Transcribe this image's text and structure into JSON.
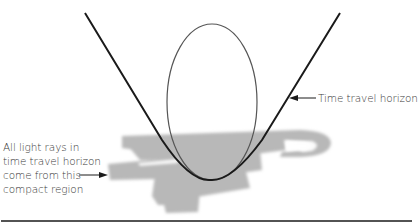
{
  "figure": {
    "labels": {
      "horizon": "Time travel horizon",
      "region_lines": [
        "All light rays in",
        "time travel horizon",
        "come from this",
        "compact region"
      ]
    },
    "colors": {
      "background": "#ffffff",
      "curve": "#1a1a1a",
      "ellipse": "#555555",
      "region_fill": "#b8b8b8",
      "text": "#3a3a3a",
      "baseline": "#1a1a1a"
    },
    "elements": {
      "horizon_curve": "V-shaped parabola with vertex near bottom center",
      "closed_timelike_loop": "vertical ellipse inside the horizon",
      "compact_region": "gray brush-stroke shaded region around curve vertex",
      "baseline": "horizontal rule at bottom of figure"
    }
  }
}
